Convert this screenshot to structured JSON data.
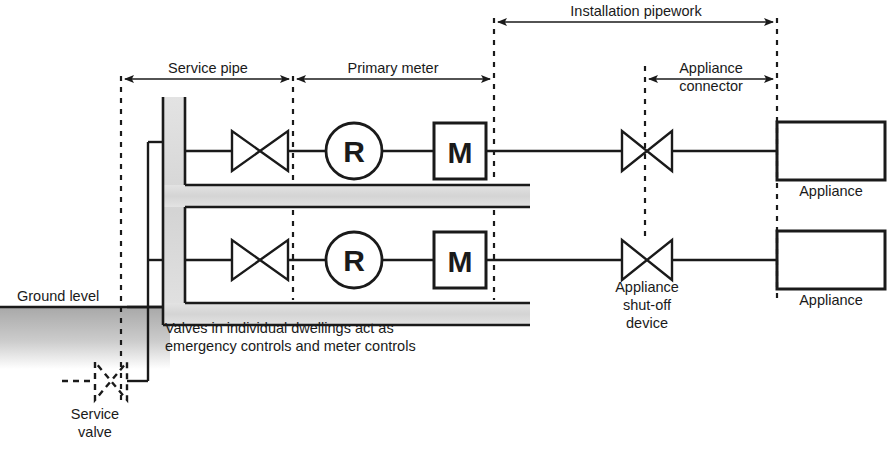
{
  "diagram": {
    "colors": {
      "line": "#1a1a1a",
      "text": "#1a1a1a",
      "duct_fill": "#d9d9d9",
      "ground_fill": "#b4b4b4",
      "background": "#ffffff"
    },
    "dimension_labels": [
      {
        "id": "installation-pipework",
        "text": "Installation pipework"
      },
      {
        "id": "service-pipe",
        "text": "Service pipe"
      },
      {
        "id": "primary-meter",
        "text": "Primary meter"
      },
      {
        "id": "appliance-connector-line1",
        "text": "Appliance"
      },
      {
        "id": "appliance-connector-line2",
        "text": "connector"
      }
    ],
    "annotations": [
      {
        "id": "ground-level",
        "text": "Ground level"
      },
      {
        "id": "service-valve-line1",
        "text": "Service"
      },
      {
        "id": "service-valve-line2",
        "text": "valve"
      },
      {
        "id": "note-line1",
        "text": "Valves in individual dwellings act as"
      },
      {
        "id": "note-line2",
        "text": "emergency controls and meter controls"
      },
      {
        "id": "shutoff-line1",
        "text": "Appliance"
      },
      {
        "id": "shutoff-line2",
        "text": "shut-off"
      },
      {
        "id": "shutoff-line3",
        "text": "device"
      },
      {
        "id": "appliance-top",
        "text": "Appliance"
      },
      {
        "id": "appliance-bottom",
        "text": "Appliance"
      }
    ],
    "symbols": {
      "regulator": "R",
      "meter": "M"
    },
    "branches": [
      {
        "id": "upper-dwelling",
        "regulator": "R",
        "meter": "M",
        "appliance_label": "Appliance"
      },
      {
        "id": "lower-dwelling",
        "regulator": "R",
        "meter": "M",
        "appliance_label": "Appliance"
      }
    ]
  }
}
